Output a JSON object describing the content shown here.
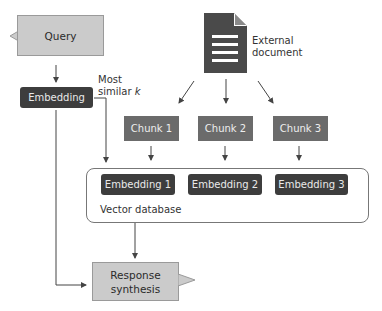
{
  "diagram": {
    "query": {
      "label": "Query"
    },
    "embedding": {
      "label": "Embedding"
    },
    "most_similar_label": [
      "Most",
      "similar k"
    ],
    "external_document": {
      "label_lines": [
        "External",
        "document"
      ],
      "icon": "document-icon"
    },
    "chunks": [
      {
        "label": "Chunk 1"
      },
      {
        "label": "Chunk 2"
      },
      {
        "label": "Chunk 3"
      }
    ],
    "vector_database": {
      "label": "Vector database",
      "embeddings": [
        {
          "label": "Embedding 1"
        },
        {
          "label": "Embedding 2"
        },
        {
          "label": "Embedding 3"
        }
      ]
    },
    "response_synthesis": {
      "label_lines": [
        "Response",
        "synthesis"
      ]
    }
  },
  "colors": {
    "light_box": "#cbcbcb",
    "dark_pill": "#3d3d3d",
    "chunk": "#6b6b6b",
    "document": "#4a4a4a",
    "line": "#444444"
  }
}
